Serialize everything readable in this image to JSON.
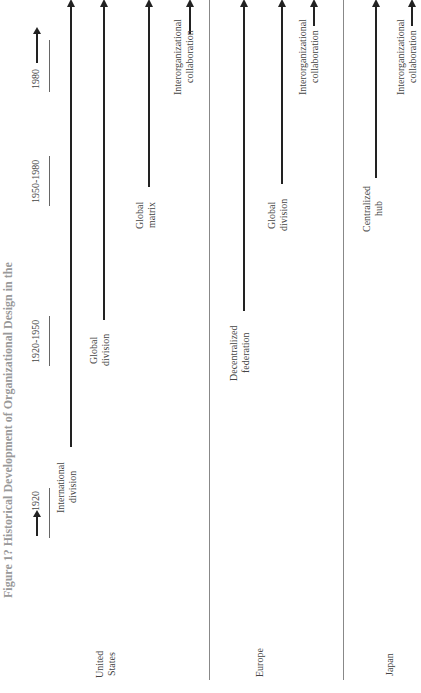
{
  "figure": {
    "title": "Figure 1? Historical Development of Organizational Design in the",
    "orientation": "rotated 90 degrees counterclockwise"
  },
  "periods": [
    {
      "label": "1920"
    },
    {
      "label": "1920-1950"
    },
    {
      "label": "1950-1980"
    },
    {
      "label": "1980"
    }
  ],
  "regions": [
    {
      "name": "United States",
      "name_lines": [
        "United",
        "States"
      ],
      "designs": [
        {
          "lines": [
            "International",
            "division"
          ]
        },
        {
          "lines": [
            "Global",
            "division"
          ]
        },
        {
          "lines": [
            "Global",
            "matrix"
          ]
        },
        {
          "lines": [
            "Interorganizational",
            "collaboration"
          ]
        }
      ]
    },
    {
      "name": "Europe",
      "name_lines": [
        "Europe"
      ],
      "designs": [
        {
          "lines": [
            "Decentralized",
            "federation"
          ]
        },
        {
          "lines": [
            "Global",
            "division"
          ]
        },
        {
          "lines": [
            "Interorganizational",
            "collaboration"
          ]
        }
      ]
    },
    {
      "name": "Japan",
      "name_lines": [
        "Japan"
      ],
      "designs": [
        {
          "lines": [
            "Centralized",
            "hub"
          ]
        },
        {
          "lines": [
            "Interorganizational",
            "collaboration"
          ]
        }
      ]
    }
  ]
}
